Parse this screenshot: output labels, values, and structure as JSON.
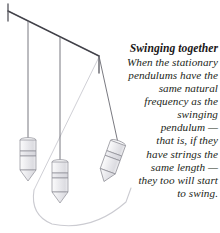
{
  "figure": {
    "name": "pendulum-resonance-diagram",
    "background_color": "#ffffff"
  },
  "caption": {
    "title": "Swinging together",
    "body_text": "When the stationary pendulums have the same natural frequency as the swinging pendulum — that is, if they have strings the same length — they too will start to swing.",
    "alignment": "right",
    "text_color": "#231f20",
    "lines": [
      "When the stationary",
      "pendulums have the",
      "same natural",
      "frequency as the",
      "swinging",
      "pendulum —",
      "that is, if they",
      "have strings the",
      "same length —",
      "they too will start",
      "to swing."
    ]
  },
  "diagram": {
    "support_bar": {
      "label": "support-bar",
      "color": "#4a4a52",
      "start": [
        8,
        11
      ],
      "end": [
        99,
        56
      ],
      "end_cap_length": 16
    },
    "swing_arc": {
      "label": "swing-arc",
      "color": "#c9c9cf",
      "description": "light gray arc showing the swing path of the third pendulum"
    },
    "pendulums": [
      {
        "name": "pendulum-1-stationary",
        "state": "stationary",
        "string_color": "#6a6a72",
        "bob_fill": "#eeeef0",
        "bob_stroke": "#8e8e96",
        "pivot": [
          28,
          21
        ],
        "bob_center": [
          28,
          160
        ],
        "tilt_degrees": 0
      },
      {
        "name": "pendulum-2-stationary",
        "state": "stationary",
        "string_color": "#6a6a72",
        "bob_fill": "#eeeef0",
        "bob_stroke": "#8e8e96",
        "pivot": [
          60,
          36
        ],
        "bob_center": [
          60,
          182
        ],
        "tilt_degrees": 0
      },
      {
        "name": "pendulum-3-swinging",
        "state": "swinging",
        "string_color": "#6a6a72",
        "bob_fill": "#eeeef0",
        "bob_stroke": "#8e8e96",
        "pivot": [
          99,
          56
        ],
        "bob_center": [
          118,
          164
        ],
        "tilt_degrees": 20
      }
    ],
    "bob_shape": {
      "description": "cylindrical weight with horizontal band and conical point at bottom",
      "width": 16,
      "body_height": 30,
      "tip_height": 10
    }
  }
}
